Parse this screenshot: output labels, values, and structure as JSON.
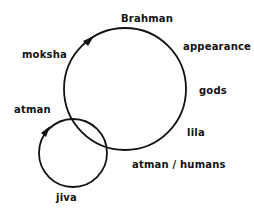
{
  "diagram": {
    "colors": {
      "stroke": "#111111",
      "text": "#111111",
      "background": "#ffffff"
    },
    "circles": [
      {
        "name": "brahman-circle",
        "cx": 125,
        "cy": 89,
        "r": 61
      },
      {
        "name": "jiva-circle",
        "cx": 73,
        "cy": 153,
        "r": 34
      }
    ],
    "arrows": [
      {
        "name": "moksha-arrow",
        "on": "brahman-circle",
        "direction": "clockwise"
      },
      {
        "name": "atman-arrow",
        "on": "jiva-circle",
        "direction": "clockwise"
      }
    ],
    "labels": {
      "brahman": "Brahman",
      "appearance": "appearance",
      "moksha": "moksha",
      "gods": "gods",
      "atman": "atman",
      "lila": "lila",
      "atman_humans": "atman / humans",
      "jiva": "jiva"
    }
  }
}
